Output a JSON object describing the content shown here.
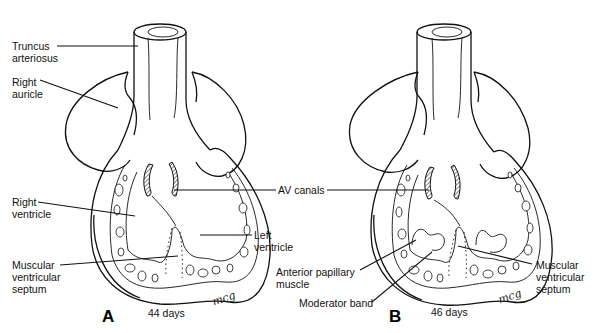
{
  "figure": {
    "type": "anatomical illustration",
    "panels": [
      {
        "letter": "A",
        "age": "44 days",
        "signature": "mcg",
        "labels": {
          "truncus": "Truncus\narteriosus",
          "right_auricle": "Right\nauricle",
          "right_ventricle": "Right\nventricle",
          "muscular_septum": "Muscular\nventricular\nseptum",
          "left_ventricle": "Left\nventricle"
        }
      },
      {
        "letter": "B",
        "age": "46 days",
        "signature": "mcg",
        "labels": {
          "anterior_papillary": "Anterior papillary\nmuscle",
          "moderator_band": "Moderator band",
          "muscular_septum": "Muscular\nventricular\nseptum"
        }
      }
    ],
    "shared_labels": {
      "av_canals": "AV canals"
    },
    "colors": {
      "line": "#111111",
      "background": "#ffffff"
    }
  }
}
